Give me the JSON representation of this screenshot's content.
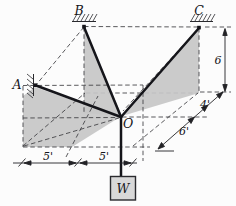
{
  "diagram": {
    "point_labels": {
      "A": "A",
      "B": "B",
      "C": "C",
      "O": "O"
    },
    "weight_label": "W",
    "dimensions": {
      "height_right": "6",
      "depth_back": "4'",
      "depth_front": "6'",
      "bottom_left_span": "5'",
      "bottom_right_span": "5'"
    },
    "colors": {
      "cable": "#15151a",
      "dashed_line": "#3c3c40",
      "shaded_plane": "#c7c7c7",
      "weight_box_fill": "#d8d8d8",
      "background": "#fcfcfc"
    }
  }
}
